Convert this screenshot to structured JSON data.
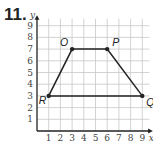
{
  "problem": {
    "number": "11."
  },
  "chart_data": {
    "type": "scatter",
    "title": "",
    "xlabel": "x",
    "ylabel": "y",
    "xlim": [
      0,
      9
    ],
    "ylim": [
      0,
      9
    ],
    "grid": true,
    "x_ticks": [
      "1",
      "2",
      "3",
      "4",
      "5",
      "6",
      "7",
      "8",
      "9"
    ],
    "y_ticks": [
      "1",
      "2",
      "3",
      "4",
      "5",
      "6",
      "7",
      "8",
      "9"
    ],
    "points": [
      {
        "label": "R",
        "x": 1,
        "y": 3
      },
      {
        "label": "O",
        "x": 3,
        "y": 7
      },
      {
        "label": "P",
        "x": 6,
        "y": 7
      },
      {
        "label": "Q",
        "x": 9,
        "y": 3
      }
    ],
    "polygon": [
      "R",
      "O",
      "P",
      "Q"
    ],
    "shape": "trapezoid"
  },
  "colors": {
    "grid": "#c8c8c8",
    "axis": "#222222",
    "line": "#222222"
  }
}
